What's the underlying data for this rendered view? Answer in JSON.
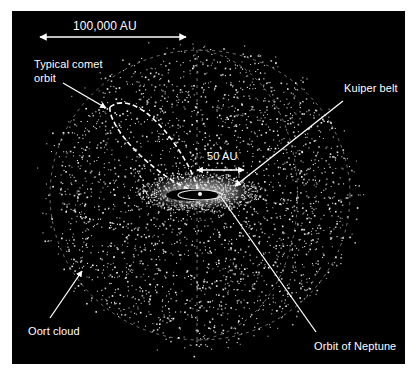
{
  "diagram": {
    "type": "solar-system-oort-cloud",
    "background_color": "#000000",
    "foreground_color": "#ffffff",
    "scale_bars": [
      {
        "label": "100,000 AU",
        "orientation": "horizontal",
        "double_headed": true
      },
      {
        "label": "50 AU",
        "orientation": "horizontal",
        "double_headed": true
      }
    ],
    "annotations": [
      {
        "id": "comet-orbit",
        "lines": [
          "Typical comet",
          "orbit"
        ]
      },
      {
        "id": "kuiper-belt",
        "lines": [
          "Kuiper belt"
        ]
      },
      {
        "id": "oort-cloud",
        "lines": [
          "Oort cloud"
        ]
      },
      {
        "id": "neptune-orbit",
        "lines": [
          "Orbit of Neptune"
        ]
      }
    ]
  },
  "labels": {
    "scale_large": "100,000 AU",
    "scale_small": "50 AU",
    "comet_line1": "Typical comet",
    "comet_line2": "orbit",
    "kuiper": "Kuiper belt",
    "oort": "Oort cloud",
    "neptune": "Orbit of Neptune"
  }
}
